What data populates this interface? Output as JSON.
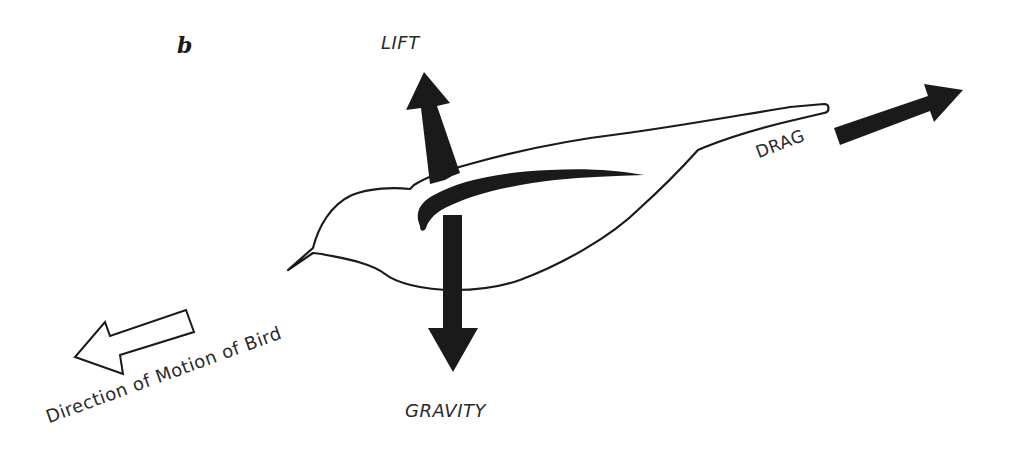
{
  "figure": {
    "panel_letter": "b",
    "forces": {
      "lift": {
        "label": "LIFT",
        "direction": "up",
        "arrow_style": "filled-black"
      },
      "gravity": {
        "label": "GRAVITY",
        "direction": "down",
        "arrow_style": "filled-black"
      },
      "drag": {
        "label": "DRAG",
        "direction": "backward-up-right",
        "arrow_style": "filled-black"
      }
    },
    "motion": {
      "label": "Direction of Motion of Bird",
      "direction": "forward-down-left",
      "arrow_style": "outlined-hollow"
    },
    "colors": {
      "ink": "#1a1a1a",
      "text": "#2a2a2a",
      "background": "#ffffff"
    }
  }
}
